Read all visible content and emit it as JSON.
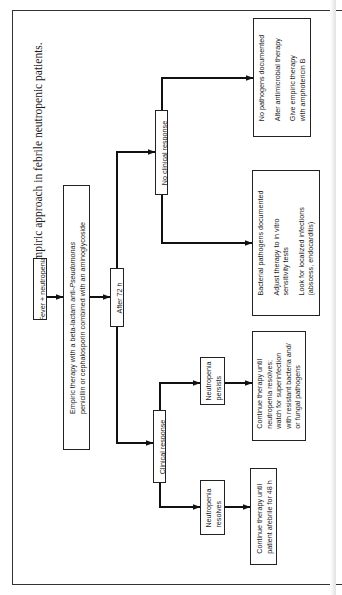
{
  "figure": {
    "title": "Empiric approach in febrile neutropenic patients.",
    "orientation": "rotated 90° counter-clockwise"
  },
  "nodes": {
    "start": {
      "label": "Fever  +  neutropenia"
    },
    "empiric": {
      "line1_prefix": "Empiric therapy with a beta-lactam anti-",
      "line1_italic": "Pseudomonas",
      "line2": "penicillin or cephalosporin combined with an aminoglycoside"
    },
    "after72": {
      "label": "After  72  h"
    },
    "no_clinical": {
      "label": "No clinical response"
    },
    "clinical": {
      "label": "Clinical response"
    },
    "no_pathogens": {
      "lines": [
        "No pathogens documented",
        "Alter antimicrobial therapy",
        "Give empiric therapy",
        "with amphotericin B"
      ]
    },
    "bacterial": {
      "lines": [
        "Bacterial pathogens documented",
        "Adjust therapy to in vitro",
        "sensitivity tests",
        "Look for localized infections",
        "(abscess, endocarditis)"
      ]
    },
    "persists": {
      "lines": [
        "Neutropenia",
        "persists"
      ]
    },
    "persists_action": {
      "lines": [
        "Continue therapy until",
        "neutropenia resolves;",
        "watch for superinfection",
        "with resistant bacteria and/",
        "or fungal pathogens"
      ]
    },
    "resolves": {
      "lines": [
        "Neutropenia",
        "resolves"
      ]
    },
    "resolves_action": {
      "lines": [
        "Continue therapy until",
        "patient afebrile for 48 h"
      ]
    }
  },
  "edges": [
    {
      "from": "start",
      "to": "empiric"
    },
    {
      "from": "empiric",
      "to": "after72"
    },
    {
      "from": "after72",
      "to": "no_clinical"
    },
    {
      "from": "after72",
      "to": "clinical"
    },
    {
      "from": "no_clinical",
      "to": "no_pathogens"
    },
    {
      "from": "no_clinical",
      "to": "bacterial"
    },
    {
      "from": "clinical",
      "to": "persists"
    },
    {
      "from": "persists",
      "to": "persists_action"
    },
    {
      "from": "clinical",
      "to": "resolves"
    },
    {
      "from": "resolves",
      "to": "resolves_action"
    }
  ]
}
